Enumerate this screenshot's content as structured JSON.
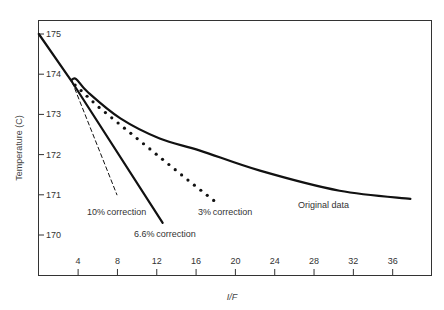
{
  "chart_data": {
    "type": "line",
    "title": "",
    "xlabel": "I/F",
    "ylabel": "Temperature (C)",
    "xlim": [
      0,
      38.5
    ],
    "ylim": [
      169.0,
      175.35
    ],
    "grid": false,
    "legend": "none (inline annotations)",
    "xticks": [
      4,
      8,
      12,
      16,
      20,
      24,
      28,
      32,
      36
    ],
    "yticks": [
      175,
      174,
      173,
      172,
      171,
      170
    ],
    "series": [
      {
        "name": "Original data",
        "style": "solid-thick",
        "x": [
          3.3,
          3.8,
          5.0,
          8.3,
          12.3,
          16.4,
          22.5,
          30.6,
          37.8
        ],
        "y": [
          173.85,
          173.88,
          173.55,
          172.9,
          172.4,
          172.1,
          171.6,
          171.1,
          170.9
        ]
      },
      {
        "name": "3% correction",
        "style": "dotted",
        "x": [
          3.4,
          6.0,
          9.0,
          12.0,
          15.0,
          18.1
        ],
        "y": [
          173.8,
          173.2,
          172.6,
          172.0,
          171.4,
          170.8
        ]
      },
      {
        "name": "6.6% correction",
        "style": "solid-thick",
        "x": [
          0.0,
          3.4,
          12.6
        ],
        "y": [
          175.0,
          173.8,
          170.3
        ]
      },
      {
        "name": "10% correction",
        "style": "dashed",
        "x": [
          3.4,
          7.95
        ],
        "y": [
          173.8,
          171.0
        ]
      }
    ],
    "annotations": [
      {
        "text": "10% correction",
        "x": 3.8,
        "y": 170.55
      },
      {
        "text": "6.6% correction",
        "x": 7.5,
        "y": 169.95
      },
      {
        "text": "3% correction",
        "x": 15.5,
        "y": 170.55
      },
      {
        "text": "Original data",
        "x": 26.5,
        "y": 170.4
      }
    ]
  },
  "labels": {
    "xlabel": "I/F",
    "ylabel": "Temperature (C)",
    "ann_10": "10% correction",
    "ann_66": "6.6% correction",
    "ann_3": "3% correction",
    "ann_orig": "Original data"
  }
}
